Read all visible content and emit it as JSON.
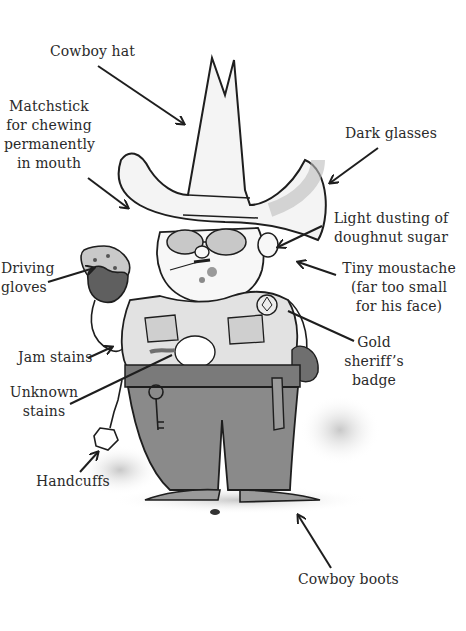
{
  "diagram": {
    "labels": [
      {
        "id": "cowboy-hat",
        "text": "Cowboy hat"
      },
      {
        "id": "matchstick",
        "text": "Matchstick\nfor chewing\npermanently\nin mouth"
      },
      {
        "id": "dark-glasses",
        "text": "Dark glasses"
      },
      {
        "id": "doughnut-sugar",
        "text": "Light dusting of\ndoughnut sugar"
      },
      {
        "id": "driving-gloves",
        "text": "Driving\ngloves"
      },
      {
        "id": "tiny-moustache",
        "text": "Tiny moustache\n(far too small\nfor his face)"
      },
      {
        "id": "jam-stains",
        "text": "Jam stains"
      },
      {
        "id": "gold-badge",
        "text": "Gold\nsheriff’s badge"
      },
      {
        "id": "unknown-stains",
        "text": "Unknown\nstains"
      },
      {
        "id": "handcuffs",
        "text": "Handcuffs"
      },
      {
        "id": "cowboy-boots",
        "text": "Cowboy boots"
      }
    ],
    "colors": {
      "ink": "#1e1e1e",
      "text": "#2a2a2a",
      "shade_light": "#d4d4d4",
      "shade_mid": "#a9a9a9",
      "shade_dark": "#6f6f6f",
      "background": "#ffffff"
    }
  }
}
